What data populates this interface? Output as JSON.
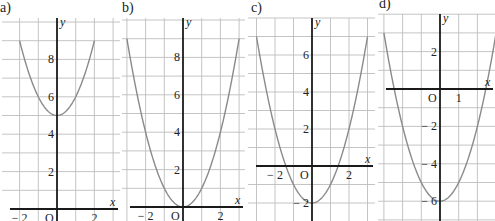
{
  "figure": {
    "background": "#ffffff",
    "grid_color": "#bdbdbd",
    "axis_color": "#1a1a1a",
    "curve_color": "#8a8a8a"
  },
  "chart_data": [
    {
      "type": "line",
      "panel_label": "a)",
      "function": "y = x^2 + 5",
      "a": 1,
      "h": 0,
      "k": 5,
      "xlabel": "x",
      "ylabel": "y",
      "x_ticks": [
        {
          "v": -2,
          "label": "− 2"
        },
        {
          "v": 2,
          "label": "2"
        }
      ],
      "y_ticks": [
        {
          "v": 2,
          "label": "2"
        },
        {
          "v": 4,
          "label": "4"
        },
        {
          "v": 6,
          "label": "6"
        },
        {
          "v": 8,
          "label": "8"
        }
      ],
      "origin_label": "O",
      "xlim": [
        -3,
        3.3
      ],
      "ylim": [
        0,
        9.5
      ],
      "curve_x_range": [
        -2,
        2
      ],
      "grid": true,
      "layout": {
        "ox": 57,
        "oy": 209,
        "unit": 18.7,
        "left": 2,
        "right": 120,
        "top": 18,
        "bottom": 221
      }
    },
    {
      "type": "line",
      "panel_label": "b)",
      "function": "y = x^2",
      "a": 1,
      "h": 0,
      "k": 0,
      "xlabel": "x",
      "ylabel": "y",
      "x_ticks": [
        {
          "v": -2,
          "label": "− 2"
        },
        {
          "v": 2,
          "label": "2"
        }
      ],
      "y_ticks": [
        {
          "v": 2,
          "label": "2"
        },
        {
          "v": 4,
          "label": "4"
        },
        {
          "v": 6,
          "label": "6"
        },
        {
          "v": 8,
          "label": "8"
        }
      ],
      "origin_label": "O",
      "xlim": [
        -3,
        3
      ],
      "ylim": [
        0,
        9.5
      ],
      "curve_x_range": [
        -3,
        3
      ],
      "grid": true,
      "layout": {
        "ox": 183,
        "oy": 207,
        "unit": 18.7,
        "left": 122,
        "right": 245,
        "top": 18,
        "bottom": 221
      }
    },
    {
      "type": "line",
      "panel_label": "c)",
      "function": "y = x^2 - 2",
      "a": 1,
      "h": 0,
      "k": -2,
      "xlabel": "x",
      "ylabel": "y",
      "x_ticks": [
        {
          "v": -2,
          "label": "− 2"
        },
        {
          "v": 2,
          "label": "2"
        }
      ],
      "y_ticks": [
        {
          "v": -2,
          "label": "− 2"
        },
        {
          "v": 2,
          "label": "2"
        },
        {
          "v": 4,
          "label": "4"
        },
        {
          "v": 6,
          "label": "6"
        }
      ],
      "origin_label": "O",
      "xlim": [
        -3,
        3.3
      ],
      "ylim": [
        -2.9,
        7.5
      ],
      "curve_x_range": [
        -3,
        3
      ],
      "grid": true,
      "layout": {
        "ox": 312,
        "oy": 166,
        "unit": 18.5,
        "left": 248,
        "right": 375,
        "top": 18,
        "bottom": 221
      }
    },
    {
      "type": "line",
      "panel_label": "d)",
      "function": "y = x^2 - 6",
      "a": 1,
      "h": 0,
      "k": -6,
      "xlabel": "x",
      "ylabel": "y",
      "x_ticks": [
        {
          "v": 1,
          "label": "1"
        }
      ],
      "y_ticks": [
        {
          "v": -6,
          "label": "− 6"
        },
        {
          "v": -4,
          "label": "− 4"
        },
        {
          "v": -2,
          "label": "− 2"
        },
        {
          "v": 2,
          "label": "2"
        }
      ],
      "origin_label": "O",
      "xlim": [
        -3.2,
        3
      ],
      "ylim": [
        -7,
        3.4
      ],
      "curve_x_range": [
        -3,
        3
      ],
      "grid": true,
      "layout": {
        "ox": 440,
        "oy": 89,
        "unit": 18.7,
        "left": 378,
        "right": 495,
        "top": 14,
        "bottom": 221
      }
    }
  ]
}
